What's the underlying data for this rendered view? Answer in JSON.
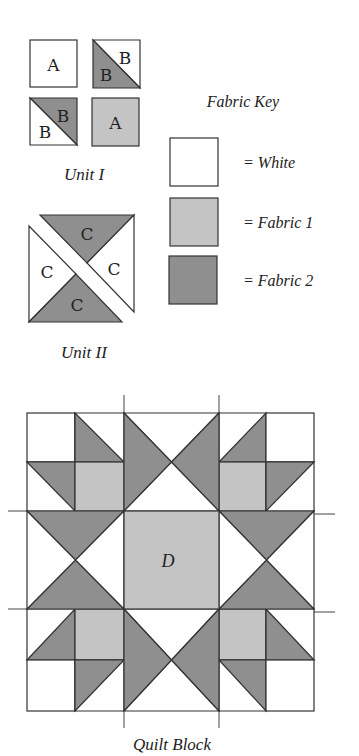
{
  "colors": {
    "white": "#ffffff",
    "fabric1": "#c4c4c4",
    "fabric2": "#8f8f8f",
    "stroke": "#333333"
  },
  "unit1": {
    "title": "Unit I",
    "pieces": [
      {
        "name": "unit1-square-a-white",
        "label": "A",
        "type": "square",
        "fabric": "white"
      },
      {
        "name": "unit1-hst-b-top",
        "labels": [
          "B",
          "B"
        ],
        "type": "half-square-triangle",
        "fabrics": [
          "white",
          "fabric2"
        ]
      },
      {
        "name": "unit1-hst-b-bottom",
        "labels": [
          "B",
          "B"
        ],
        "type": "half-square-triangle",
        "fabrics": [
          "fabric2",
          "white"
        ]
      },
      {
        "name": "unit1-square-a-fabric1",
        "label": "A",
        "type": "square",
        "fabric": "fabric1"
      }
    ]
  },
  "unit2": {
    "title": "Unit II",
    "pieces": [
      {
        "name": "unit2-top",
        "label": "C",
        "fabric": "fabric2"
      },
      {
        "name": "unit2-right",
        "label": "C",
        "fabric": "white"
      },
      {
        "name": "unit2-left",
        "label": "C",
        "fabric": "white"
      },
      {
        "name": "unit2-bottom",
        "label": "C",
        "fabric": "fabric2"
      }
    ]
  },
  "fabric_key": {
    "title": "Fabric Key",
    "items": [
      {
        "fabric": "white",
        "label": "= White"
      },
      {
        "fabric": "fabric1",
        "label": "= Fabric 1"
      },
      {
        "fabric": "fabric2",
        "label": "= Fabric 2"
      }
    ]
  },
  "quilt_block": {
    "title": "Quilt Block",
    "center_label": "D",
    "grid_x": [
      27,
      75,
      124,
      219,
      266,
      314
    ],
    "grid_y": [
      413,
      462,
      511,
      609,
      660,
      711
    ]
  }
}
